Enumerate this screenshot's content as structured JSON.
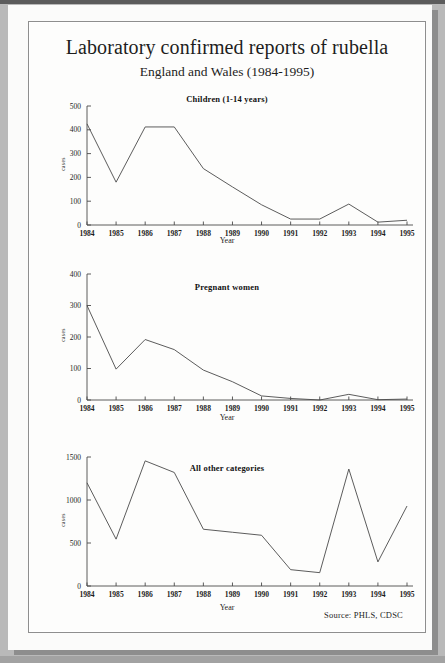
{
  "document": {
    "title": "Laboratory confirmed reports of rubella",
    "subtitle": "England and Wales (1984-1995)",
    "source": "Source: PHLS, CDSC"
  },
  "chart_data": [
    {
      "type": "line",
      "title": "Children (1-14 years)",
      "xlabel": "Year",
      "ylabel": "cases",
      "categories": [
        "1984",
        "1985",
        "1986",
        "1987",
        "1988",
        "1989",
        "1990",
        "1991",
        "1992",
        "1993",
        "1994",
        "1995"
      ],
      "values": [
        425,
        180,
        412,
        412,
        237,
        160,
        85,
        25,
        25,
        88,
        12,
        20
      ],
      "ylim": [
        0,
        500
      ],
      "yticks": [
        0,
        100,
        200,
        300,
        400,
        500
      ],
      "grid": false,
      "legend": "none"
    },
    {
      "type": "line",
      "title": "Pregnant women",
      "xlabel": "Year",
      "ylabel": "cases",
      "categories": [
        "1984",
        "1985",
        "1986",
        "1987",
        "1988",
        "1989",
        "1990",
        "1991",
        "1992",
        "1993",
        "1994",
        "1995"
      ],
      "values": [
        300,
        98,
        192,
        160,
        95,
        58,
        13,
        5,
        0,
        18,
        1,
        3
      ],
      "ylim": [
        0,
        400
      ],
      "yticks": [
        0,
        100,
        200,
        300,
        400
      ],
      "grid": false,
      "legend": "none"
    },
    {
      "type": "line",
      "title": "All other categories",
      "xlabel": "Year",
      "ylabel": "cases",
      "categories": [
        "1984",
        "1985",
        "1986",
        "1987",
        "1988",
        "1989",
        "1990",
        "1991",
        "1992",
        "1993",
        "1994",
        "1995"
      ],
      "values": [
        1200,
        545,
        1455,
        1320,
        660,
        625,
        590,
        190,
        155,
        1360,
        280,
        930
      ],
      "ylim": [
        0,
        1500
      ],
      "yticks": [
        0,
        500,
        1000,
        1500
      ],
      "grid": false,
      "legend": "none"
    }
  ]
}
